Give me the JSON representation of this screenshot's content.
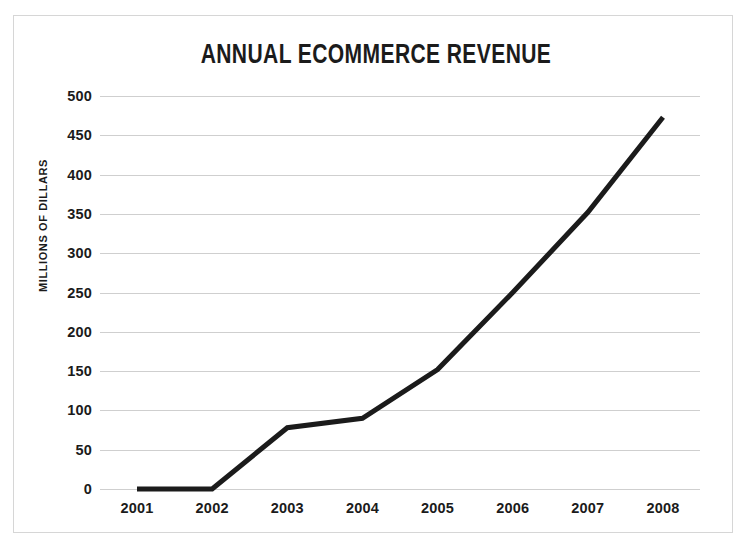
{
  "chart_data": {
    "type": "line",
    "title": "ANNUAL ECOMMERCE REVENUE",
    "xlabel": "",
    "ylabel": "MILLIONS OF DILLARS",
    "categories": [
      "2001",
      "2002",
      "2003",
      "2004",
      "2005",
      "2006",
      "2007",
      "2008"
    ],
    "x": [
      2001,
      2002,
      2003,
      2004,
      2005,
      2006,
      2007,
      2008
    ],
    "values": [
      0,
      0,
      78,
      90,
      152,
      250,
      352,
      473
    ],
    "series": [
      {
        "name": "Annual eCommerce Revenue",
        "values": [
          0,
          0,
          78,
          90,
          152,
          250,
          352,
          473
        ]
      }
    ],
    "ylim": [
      0,
      500
    ],
    "yticks": [
      0,
      50,
      100,
      150,
      200,
      250,
      300,
      350,
      400,
      450,
      500
    ],
    "ytick_labels": [
      "0",
      "50",
      "100",
      "150",
      "200",
      "250",
      "300",
      "350",
      "400",
      "450",
      "500"
    ],
    "grid": true,
    "grid_axis": "y",
    "legend": false,
    "legend_position": "none",
    "line_color": "#1b1b1b",
    "grid_color": "#cfcfcf",
    "background_color": "#ffffff",
    "border_color": "#d6d6d6",
    "line_width": 5,
    "markers": false
  }
}
